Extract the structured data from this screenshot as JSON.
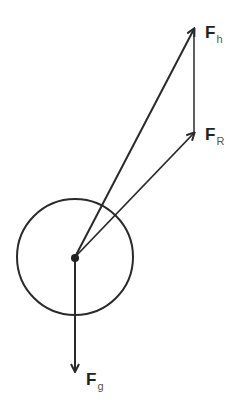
{
  "diagram": {
    "colors": {
      "stroke": "#2a2a2a",
      "label": "#222222",
      "subscript": "#555555",
      "background": "#ffffff"
    },
    "body": {
      "shape": "circle",
      "name": "ball"
    },
    "vectors": [
      {
        "id": "Fh",
        "symbol": "F",
        "subscript": "h",
        "direction": "up-right (steep)"
      },
      {
        "id": "FR",
        "symbol": "F",
        "subscript": "R",
        "direction": "up-right"
      },
      {
        "id": "Fg",
        "symbol": "F",
        "subscript": "g",
        "direction": "down"
      }
    ],
    "connector": {
      "from": "Fh",
      "to": "FR",
      "style": "vertical line"
    }
  }
}
